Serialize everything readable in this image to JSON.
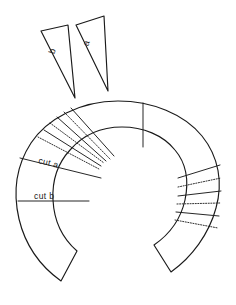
{
  "figure": {
    "background_color": "#ffffff",
    "line_color": "#1a1a1a"
  },
  "wedges": [
    {
      "id": "wedge-b",
      "label": "b",
      "label_x": 55,
      "label_y": 52,
      "label_rotate": -72
    },
    {
      "id": "wedge-a",
      "label": "a",
      "label_x": 89,
      "label_y": 44,
      "label_rotate": -72
    }
  ],
  "annotations": [
    {
      "id": "cut-a",
      "text": "cut  a",
      "x": 38,
      "y": 163,
      "rotate": 14
    },
    {
      "id": "cut-b",
      "text": "cut  b",
      "x": 34,
      "y": 199,
      "rotate": 0
    }
  ],
  "cut_lines": [
    {
      "id": "cut-line-a",
      "x1": 20,
      "y1": 158,
      "x2": 101,
      "y2": 178
    },
    {
      "id": "cut-line-b",
      "x1": 18,
      "y1": 201,
      "x2": 89,
      "y2": 201
    }
  ],
  "segments_left": [
    {
      "id": "left-seg-1",
      "x1": 71,
      "y1": 108,
      "x2": 114,
      "y2": 156
    },
    {
      "id": "left-seg-2",
      "x1": 57,
      "y1": 117,
      "x2": 106,
      "y2": 161
    },
    {
      "id": "left-seg-3",
      "x1": 44,
      "y1": 130,
      "x2": 101,
      "y2": 166
    }
  ],
  "segments_right": [
    {
      "id": "right-seg-1",
      "x1": 178,
      "y1": 178,
      "x2": 220,
      "y2": 165
    },
    {
      "id": "right-seg-2",
      "x1": 178,
      "y1": 196,
      "x2": 221,
      "y2": 191
    },
    {
      "id": "right-seg-3",
      "x1": 176,
      "y1": 212,
      "x2": 219,
      "y2": 216
    }
  ],
  "dotted_lines_left": [
    {
      "id": "dot-left-1",
      "x1": 64,
      "y1": 112,
      "x2": 110,
      "y2": 159
    },
    {
      "id": "dot-left-2",
      "x1": 50,
      "y1": 123,
      "x2": 104,
      "y2": 163
    },
    {
      "id": "dot-left-3",
      "x1": 38,
      "y1": 137,
      "x2": 99,
      "y2": 169
    }
  ],
  "dotted_lines_right": [
    {
      "id": "dot-right-1",
      "x1": 178,
      "y1": 187,
      "x2": 221,
      "y2": 178
    },
    {
      "id": "dot-right-2",
      "x1": 177,
      "y1": 204,
      "x2": 220,
      "y2": 203
    },
    {
      "id": "dot-right-3",
      "x1": 175,
      "y1": 220,
      "x2": 218,
      "y2": 228
    }
  ],
  "radial_lines": [
    {
      "id": "radial-top",
      "x1": 143,
      "y1": 103,
      "x2": 143,
      "y2": 147
    }
  ],
  "shapes": {
    "annulus_path": "M 118 101 C 152 101, 184 114, 202 136 C 219 157, 223 183, 216 208 C 209 234, 192 257, 171 272 L 154 245 C 170 234, 181 218, 185 200 C 189 181, 186 163, 175 150 C 163 135, 143 127, 122 127 C 101 127, 83 135, 70 150 C 58 163, 52 181, 53 200 C 54 220, 62 238, 77 251 L 61 281 C 40 266, 25 244, 19 219 C 13 193, 16 166, 31 143 C 47 119, 80 101, 118 101 Z",
    "wedge_b_path": "M 41 31 L 68 25 L 75 98 Z",
    "wedge_a_path": "M 76 25 L 104 16 L 108 91 Z"
  }
}
